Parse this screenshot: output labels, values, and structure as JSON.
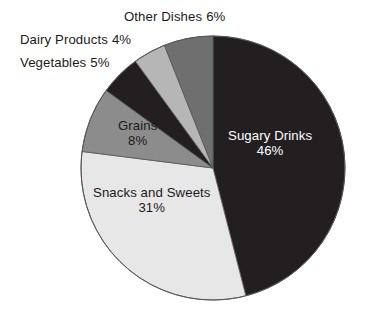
{
  "chart_data": {
    "type": "pie",
    "title": "",
    "categories": [
      "Sugary Drinks",
      "Snacks and Sweets",
      "Grains",
      "Vegetables",
      "Dairy Products",
      "Other Dishes"
    ],
    "values": [
      46,
      31,
      8,
      5,
      4,
      6
    ],
    "value_suffix": "%",
    "start_angle_deg": 0,
    "direction": "clockwise",
    "legend": "none",
    "grid": false,
    "slices": [
      {
        "label": "Sugary Drinks",
        "value": 46,
        "percent_text": "46%",
        "color": "#231f20",
        "label_placement": "inside",
        "text_color": "#ffffff"
      },
      {
        "label": "Snacks and Sweets",
        "value": 31,
        "percent_text": "31%",
        "color": "#e7e7e7",
        "label_placement": "inside",
        "text_color": "#1a1a1a"
      },
      {
        "label": "Grains",
        "value": 8,
        "percent_text": "8%",
        "color": "#8c8c8c",
        "label_placement": "inside",
        "text_color": "#1a1a1a"
      },
      {
        "label": "Vegetables",
        "value": 5,
        "percent_text": "5%",
        "color": "#231f20",
        "label_placement": "outside",
        "text_color": "#1a1a1a"
      },
      {
        "label": "Dairy Products",
        "value": 4,
        "percent_text": "4%",
        "color": "#b6b6b6",
        "label_placement": "outside",
        "text_color": "#1a1a1a"
      },
      {
        "label": "Other Dishes",
        "value": 6,
        "percent_text": "6%",
        "color": "#6f6f6f",
        "label_placement": "outside",
        "text_color": "#1a1a1a"
      }
    ],
    "geometry": {
      "center_x": 213,
      "center_y": 168,
      "radius": 132,
      "outline_color": "#555555"
    }
  },
  "labels": {
    "other_dishes": {
      "name": "Other Dishes",
      "percent": "6%"
    },
    "dairy_products": {
      "name": "Dairy Products",
      "percent": "4%"
    },
    "vegetables": {
      "name": "Vegetables",
      "percent": "5%"
    },
    "sugary_drinks": {
      "name": "Sugary Drinks",
      "percent": "46%"
    },
    "snacks_sweets": {
      "name": "Snacks and Sweets",
      "percent": "31%"
    },
    "grains": {
      "name": "Grains",
      "percent": "8%"
    }
  }
}
